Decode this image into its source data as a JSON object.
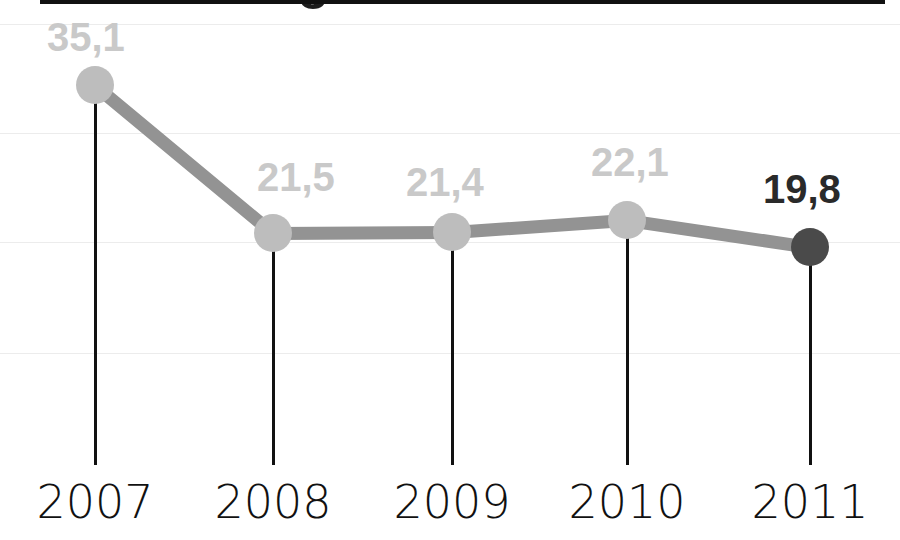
{
  "chart_data": {
    "type": "line",
    "title": "",
    "subtitle": "",
    "xlabel": "",
    "ylabel": "",
    "categories": [
      "2007",
      "2008",
      "2009",
      "2010",
      "2011"
    ],
    "values": [
      35.1,
      21.5,
      21.4,
      22.1,
      19.8
    ],
    "value_labels": [
      "35,1",
      "21,5",
      "21,4",
      "22,1",
      "19,8"
    ],
    "decimal_separator": ",",
    "highlight_index": 4,
    "series": [
      {
        "name": "",
        "values": [
          35.1,
          21.5,
          21.4,
          22.1,
          19.8
        ]
      }
    ],
    "ylim": [
      0,
      44
    ],
    "grid": true,
    "gridlines_y": [
      44,
      33,
      22,
      11
    ],
    "legend": "none",
    "legend_position": "none",
    "annotations": [],
    "colors": {
      "line": "#939393",
      "marker": "#bdbdbd",
      "marker_highlight": "#4a4a4a",
      "label": "#c9c9c9",
      "label_highlight": "#2a2a2a",
      "axis": "#111111",
      "grid": "#ececec",
      "background": "#ffffff"
    }
  },
  "axis": {
    "tick_labels": [
      "2007",
      "2008",
      "2009",
      "2010",
      "2011"
    ]
  },
  "points": [
    {
      "year": "2007",
      "label": "35,1",
      "x": 95,
      "y": 85,
      "highlight": false
    },
    {
      "year": "2008",
      "label": "21,5",
      "x": 273,
      "y": 233,
      "highlight": false
    },
    {
      "year": "2009",
      "label": "21,4",
      "x": 452,
      "y": 232,
      "highlight": false
    },
    {
      "year": "2010",
      "label": "22,1",
      "x": 627,
      "y": 220,
      "highlight": false
    },
    {
      "year": "2011",
      "label": "19,8",
      "x": 810,
      "y": 247,
      "highlight": true
    }
  ],
  "cut_title": {
    "text": "Arbeitslosigkeit"
  }
}
